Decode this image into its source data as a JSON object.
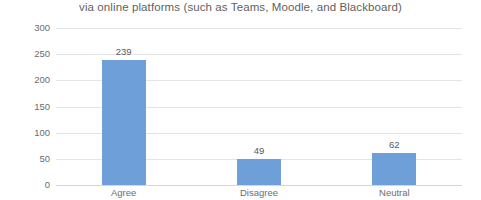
{
  "chart_data": {
    "type": "bar",
    "title": "via online platforms (such as Teams, Moodle, and Blackboard)",
    "xlabel": "",
    "ylabel": "",
    "categories": [
      "Agree",
      "Disagree",
      "Neutral"
    ],
    "values": [
      239,
      49,
      62
    ],
    "value_labels": [
      "239",
      "49",
      "62"
    ],
    "ylim": [
      0,
      300
    ],
    "yticks": [
      0,
      50,
      100,
      150,
      200,
      250,
      300
    ],
    "ytick_labels": [
      "0",
      "50",
      "100",
      "150",
      "200",
      "250",
      "300"
    ],
    "grid": true,
    "legend": false,
    "legend_position": "none",
    "series": [
      {
        "name": "Responses",
        "values": [
          239,
          49,
          62
        ]
      }
    ],
    "colors": {
      "bar": "#6f9fd8",
      "gridline": "#e4e4e4",
      "axis_text": "#6d6d6d",
      "title_text": "#5f5f5f",
      "value_text": "#595959",
      "background": "#ffffff"
    }
  }
}
